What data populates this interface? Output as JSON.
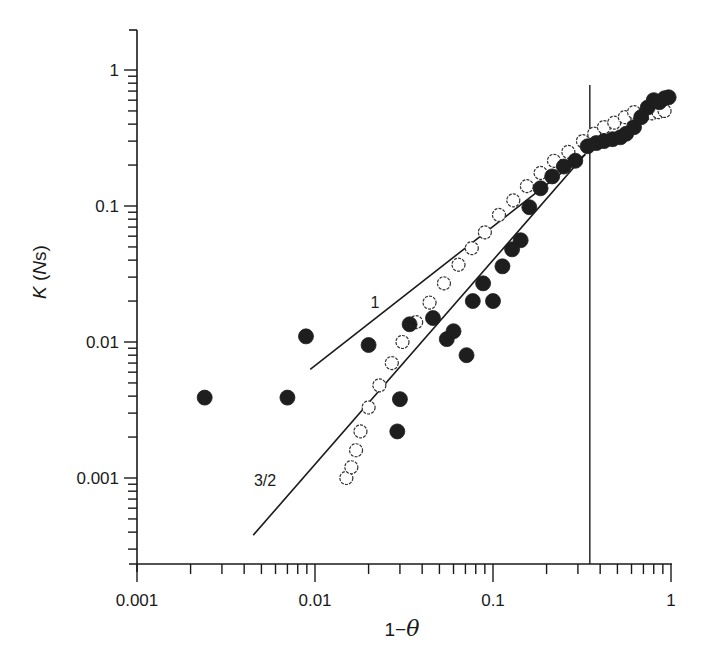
{
  "chart_data": {
    "type": "scatter",
    "title": "",
    "xlabel": "1−θ",
    "ylabel": "K (Ns)",
    "xscale": "log",
    "yscale": "log",
    "xlim": [
      0.001,
      1
    ],
    "ylim": [
      0.0002,
      2
    ],
    "x_ticks": [
      {
        "value": 0.001,
        "label": "0.001"
      },
      {
        "value": 0.01,
        "label": "0.01"
      },
      {
        "value": 0.1,
        "label": "0.1"
      },
      {
        "value": 1,
        "label": "1"
      }
    ],
    "y_ticks": [
      {
        "value": 0.001,
        "label": "0.001"
      },
      {
        "value": 0.01,
        "label": "0.01"
      },
      {
        "value": 0.1,
        "label": "0.1"
      },
      {
        "value": 1,
        "label": "1"
      }
    ],
    "grid": false,
    "legend": null,
    "vertical_reference_line": {
      "x": 0.35
    },
    "fit_lines": [
      {
        "label": "1",
        "slope": 1,
        "x_range": [
          0.0094,
          0.33
        ],
        "y_at_start": 0.0063,
        "y_at_end": 0.24
      },
      {
        "label": "3/2",
        "slope": 1.5,
        "x_range": [
          0.0045,
          0.33
        ],
        "y_at_start": 0.00038,
        "y_at_end": 0.24
      }
    ],
    "series": [
      {
        "name": "filled circles",
        "marker": "filled-circle",
        "points": [
          [
            0.0024,
            0.0039
          ],
          [
            0.007,
            0.0039
          ],
          [
            0.0089,
            0.011
          ],
          [
            0.02,
            0.0095
          ],
          [
            0.03,
            0.0038
          ],
          [
            0.029,
            0.0022
          ],
          [
            0.034,
            0.0135
          ],
          [
            0.046,
            0.015
          ],
          [
            0.055,
            0.0105
          ],
          [
            0.06,
            0.012
          ],
          [
            0.071,
            0.008
          ],
          [
            0.077,
            0.02
          ],
          [
            0.088,
            0.027
          ],
          [
            0.1,
            0.02
          ],
          [
            0.113,
            0.036
          ],
          [
            0.128,
            0.048
          ],
          [
            0.143,
            0.056
          ],
          [
            0.16,
            0.098
          ],
          [
            0.185,
            0.135
          ],
          [
            0.215,
            0.165
          ],
          [
            0.25,
            0.195
          ],
          [
            0.29,
            0.215
          ],
          [
            0.34,
            0.275
          ],
          [
            0.38,
            0.29
          ],
          [
            0.42,
            0.3
          ],
          [
            0.47,
            0.31
          ],
          [
            0.52,
            0.32
          ],
          [
            0.56,
            0.34
          ],
          [
            0.62,
            0.38
          ],
          [
            0.68,
            0.45
          ],
          [
            0.74,
            0.53
          ],
          [
            0.8,
            0.6
          ],
          [
            0.86,
            0.58
          ],
          [
            0.92,
            0.62
          ],
          [
            0.97,
            0.63
          ]
        ]
      },
      {
        "name": "open circles",
        "marker": "open-circle",
        "points": [
          [
            0.015,
            0.001
          ],
          [
            0.016,
            0.0012
          ],
          [
            0.017,
            0.0016
          ],
          [
            0.018,
            0.0022
          ],
          [
            0.02,
            0.0033
          ],
          [
            0.023,
            0.0048
          ],
          [
            0.027,
            0.007
          ],
          [
            0.031,
            0.01
          ],
          [
            0.037,
            0.014
          ],
          [
            0.044,
            0.0195
          ],
          [
            0.053,
            0.027
          ],
          [
            0.064,
            0.037
          ],
          [
            0.076,
            0.049
          ],
          [
            0.09,
            0.064
          ],
          [
            0.108,
            0.086
          ],
          [
            0.13,
            0.11
          ],
          [
            0.155,
            0.14
          ],
          [
            0.185,
            0.175
          ],
          [
            0.22,
            0.215
          ],
          [
            0.265,
            0.25
          ],
          [
            0.32,
            0.3
          ],
          [
            0.37,
            0.34
          ],
          [
            0.42,
            0.38
          ],
          [
            0.48,
            0.41
          ],
          [
            0.55,
            0.45
          ],
          [
            0.62,
            0.49
          ],
          [
            0.7,
            0.47
          ],
          [
            0.78,
            0.48
          ],
          [
            0.85,
            0.49
          ],
          [
            0.92,
            0.5
          ]
        ]
      }
    ]
  }
}
